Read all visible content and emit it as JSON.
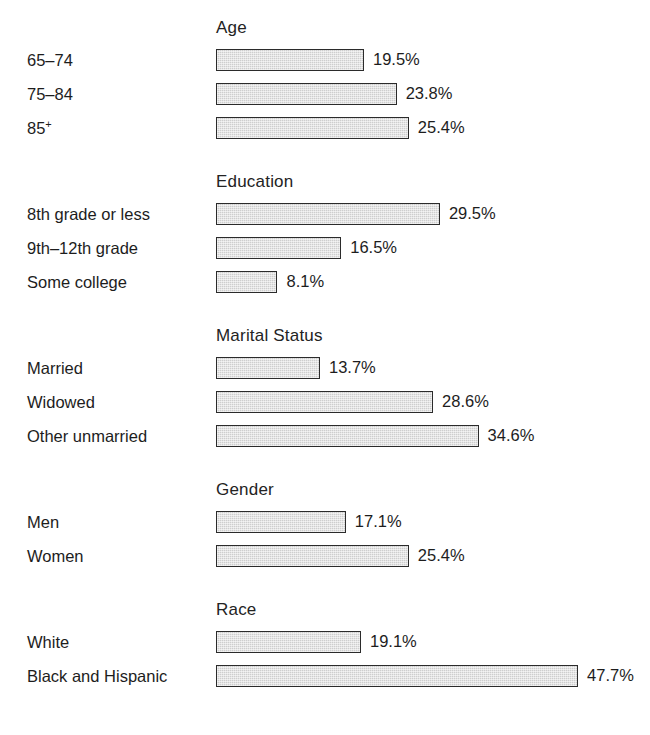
{
  "chart_data": {
    "type": "bar",
    "title": "",
    "subtitle": "",
    "xlabel": "",
    "ylabel": "",
    "orientation": "horizontal",
    "grid": false,
    "legend": "none",
    "value_suffix": "%",
    "xlim": [
      0,
      47.7
    ],
    "px_per_percent": 7.59,
    "groups": [
      {
        "heading": "Age",
        "categories": [
          "65–74",
          "75–84",
          "85+"
        ],
        "values": [
          19.5,
          23.8,
          25.4
        ],
        "labels": [
          "19.5%",
          "23.8%",
          "25.4%"
        ]
      },
      {
        "heading": "Education",
        "categories": [
          "8th grade or less",
          "9th–12th grade",
          "Some college"
        ],
        "values": [
          29.5,
          16.5,
          8.1
        ],
        "labels": [
          "29.5%",
          "16.5%",
          "8.1%"
        ]
      },
      {
        "heading": "Marital Status",
        "categories": [
          "Married",
          "Widowed",
          "Other unmarried"
        ],
        "values": [
          13.7,
          28.6,
          34.6
        ],
        "labels": [
          "13.7%",
          "28.6%",
          "34.6%"
        ]
      },
      {
        "heading": "Gender",
        "categories": [
          "Men",
          "Women"
        ],
        "values": [
          17.1,
          25.4
        ],
        "labels": [
          "17.1%",
          "25.4%"
        ]
      },
      {
        "heading": "Race",
        "categories": [
          "White",
          "Black and Hispanic"
        ],
        "values": [
          19.1,
          47.7
        ],
        "labels": [
          "19.1%",
          "47.7%"
        ]
      }
    ]
  },
  "style": {
    "bar_fill": "#d6d6d6",
    "bar_border": "#2b2b2b",
    "text_color": "#1d1d1d",
    "background": "#ffffff"
  },
  "layout": {
    "bar_origin_x": 216,
    "bar_height": 22,
    "row_pitch": 34,
    "group_gap": 22,
    "heading_offset": 30,
    "first_heading_y": 30,
    "value_gap": 9,
    "label_x": 27
  }
}
